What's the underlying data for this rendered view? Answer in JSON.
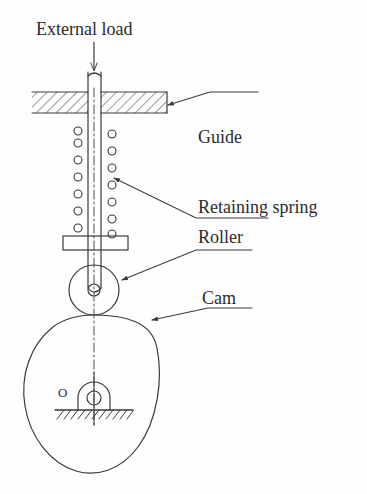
{
  "figure": {
    "type": "engineering-diagram",
    "background_color": "#fefefe",
    "line_color": "#3a3a3a",
    "text_color": "#2b2b2b"
  },
  "labels": {
    "external_load": "External load",
    "guide": "Guide",
    "retaining_spring": "Retaining spring",
    "roller": "Roller",
    "cam": "Cam",
    "pivot_point": "O"
  },
  "artifacts": {
    "ghost_bottom": "",
    "ghost_top": ""
  },
  "parts": {
    "rod": {
      "name": "follower-rod",
      "x_left": 88,
      "x_right": 101,
      "y_top": 72,
      "y_bottom": 295
    },
    "load_arrow": {
      "name": "external-load-arrow",
      "x": 94,
      "y_start": 42,
      "y_end": 72
    },
    "guide_block": {
      "name": "guide-block",
      "x_left": 32,
      "x_right": 167,
      "y_top": 92,
      "y_bottom": 113,
      "hatched": true
    },
    "spring": {
      "name": "retaining-spring",
      "coil_count_per_side": 7,
      "coil_radius": 4,
      "left_column_x": 78,
      "right_column_x": 112,
      "y_top": 128,
      "y_bottom": 238
    },
    "spring_plate": {
      "name": "spring-seat-plate",
      "x_left": 63,
      "x_right": 128,
      "y_top": 236,
      "y_bottom": 250
    },
    "roller": {
      "name": "roller",
      "center_x": 94,
      "center_y": 290,
      "radius": 25,
      "pin_radius": 6
    },
    "cam": {
      "name": "cam-profile",
      "x_left": 24,
      "x_right": 158,
      "y_top": 315,
      "y_bottom": 473
    },
    "pivot": {
      "name": "cam-pivot-bearing",
      "center_x": 94,
      "center_y": 398,
      "bore_radius": 7
    },
    "ground": {
      "name": "ground-hatching",
      "x_left": 55,
      "x_right": 133,
      "y": 410
    },
    "center_line": {
      "name": "center-line",
      "x": 94,
      "y_top": 88,
      "y_bottom": 425,
      "style": "dash-dot"
    }
  },
  "leaders": [
    {
      "name": "leader-guide",
      "target_x": 168,
      "target_y": 105,
      "elbow_x": 210,
      "elbow_y": 92,
      "end_x": 258,
      "end_y": 92
    },
    {
      "name": "leader-retaining-spring",
      "target_x": 114,
      "target_y": 178,
      "elbow_x": 196,
      "elbow_y": 218,
      "end_x": 268,
      "end_y": 218
    },
    {
      "name": "leader-roller",
      "target_x": 122,
      "target_y": 280,
      "elbow_x": 196,
      "elbow_y": 250,
      "end_x": 252,
      "end_y": 250
    },
    {
      "name": "leader-cam",
      "target_x": 152,
      "target_y": 320,
      "elbow_x": 208,
      "elbow_y": 308,
      "end_x": 252,
      "end_y": 308
    }
  ]
}
